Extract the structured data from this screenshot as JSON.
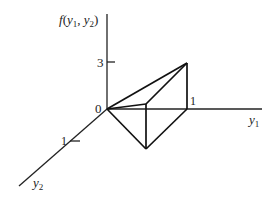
{
  "figure": {
    "axes": {
      "vertical": {
        "label_prefix": "f(y",
        "sub1": "1",
        "mid": ", y",
        "sub2": "2",
        "label_suffix": ")"
      },
      "y1": {
        "label": "y",
        "sub": "1"
      },
      "y2": {
        "label": "y",
        "sub": "2"
      }
    },
    "ticks": {
      "vertical_3": "3",
      "origin": "0",
      "y1_1": "1",
      "y2_1": "1"
    },
    "surface": {
      "description": "Pyramid-shaped density surface over unit square, apex height 3 at (y1=1, y2=0)",
      "vertices": [
        {
          "name": "origin",
          "y1": 0,
          "y2": 0,
          "f": 0
        },
        {
          "name": "y1-one",
          "y1": 1,
          "y2": 0,
          "f": 0
        },
        {
          "name": "corner",
          "y1": 1,
          "y2": 1,
          "f": 0
        },
        {
          "name": "apex",
          "y1": 1,
          "y2": 0,
          "f": 3
        },
        {
          "name": "upper-mid",
          "y1": 1,
          "y2": 1,
          "f": 0
        }
      ]
    }
  }
}
